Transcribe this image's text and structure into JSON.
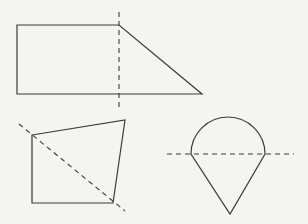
{
  "diagram": {
    "colors": {
      "background": "#f4f4f2",
      "stroke": "#3a3a3a"
    },
    "figures": [
      {
        "id": "trapezoid",
        "kind": "right trapezoid",
        "points": "17,25 119,25 202,94 17,94",
        "dashed_line": {
          "x1": 119,
          "y1": 12,
          "x2": 119,
          "y2": 108,
          "orientation": "vertical"
        }
      },
      {
        "id": "quadrilateral",
        "kind": "irregular quadrilateral",
        "points": "32,135 125,120 113,203 32,203",
        "dashed_line": {
          "x1": 19,
          "y1": 124,
          "x2": 125,
          "y2": 211,
          "orientation": "diagonal"
        }
      },
      {
        "id": "teardrop",
        "kind": "semicircle atop isosceles triangle",
        "path": "M191,154 A37,37 0 1 1 265,154 L230,214 Z",
        "dashed_line": {
          "x1": 167,
          "y1": 154,
          "x2": 294,
          "y2": 154,
          "orientation": "horizontal"
        }
      }
    ]
  }
}
